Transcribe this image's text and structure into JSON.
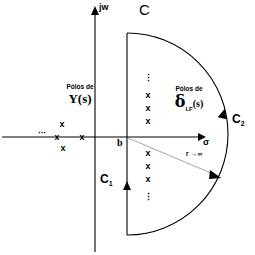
{
  "figure": {
    "background": "#ffffff",
    "ink": "#000000",
    "width": 255,
    "height": 255
  },
  "axes": {
    "imaginary_label": "jw",
    "real_label": "σ",
    "abscissa_marker": "b",
    "origin_px": {
      "x": 95,
      "y": 137
    },
    "real_axis_y": 137,
    "imag_axis_x": 95
  },
  "contour": {
    "whole_label": "C",
    "vertical_segment_label": "C",
    "vertical_segment_sub": "1",
    "arc_label": "C",
    "arc_sub": "2",
    "radius_annotation": "r →∞",
    "vertical_line_x": 127,
    "arc_extreme_x": 237
  },
  "pole_groups": [
    {
      "id": "left",
      "caption_top": "Pólos de",
      "caption_main": "Y(s)",
      "ellipsis": "⋯",
      "marks": [
        {
          "x": 62,
          "y": 124,
          "glyph": "x"
        },
        {
          "x": 57,
          "y": 137,
          "glyph": "x"
        },
        {
          "x": 82,
          "y": 137,
          "glyph": "x"
        },
        {
          "x": 63,
          "y": 148,
          "glyph": "x"
        }
      ],
      "ellipsis_pos": {
        "x": 42,
        "y": 133
      }
    },
    {
      "id": "right",
      "caption_top": "Pólos de",
      "caption_delta": "δ",
      "caption_sub": "LF",
      "caption_tail": "(s)",
      "vdots_glyph": "⋮",
      "marks": [
        {
          "x": 148,
          "y": 95,
          "glyph": "x"
        },
        {
          "x": 148,
          "y": 108,
          "glyph": "x"
        },
        {
          "x": 148,
          "y": 121,
          "glyph": "x"
        },
        {
          "x": 148,
          "y": 153,
          "glyph": "x"
        },
        {
          "x": 148,
          "y": 166,
          "glyph": "x"
        },
        {
          "x": 148,
          "y": 179,
          "glyph": "x"
        }
      ],
      "vdots_top": {
        "x": 148,
        "y": 78
      },
      "vdots_bottom": {
        "x": 148,
        "y": 197
      }
    }
  ]
}
